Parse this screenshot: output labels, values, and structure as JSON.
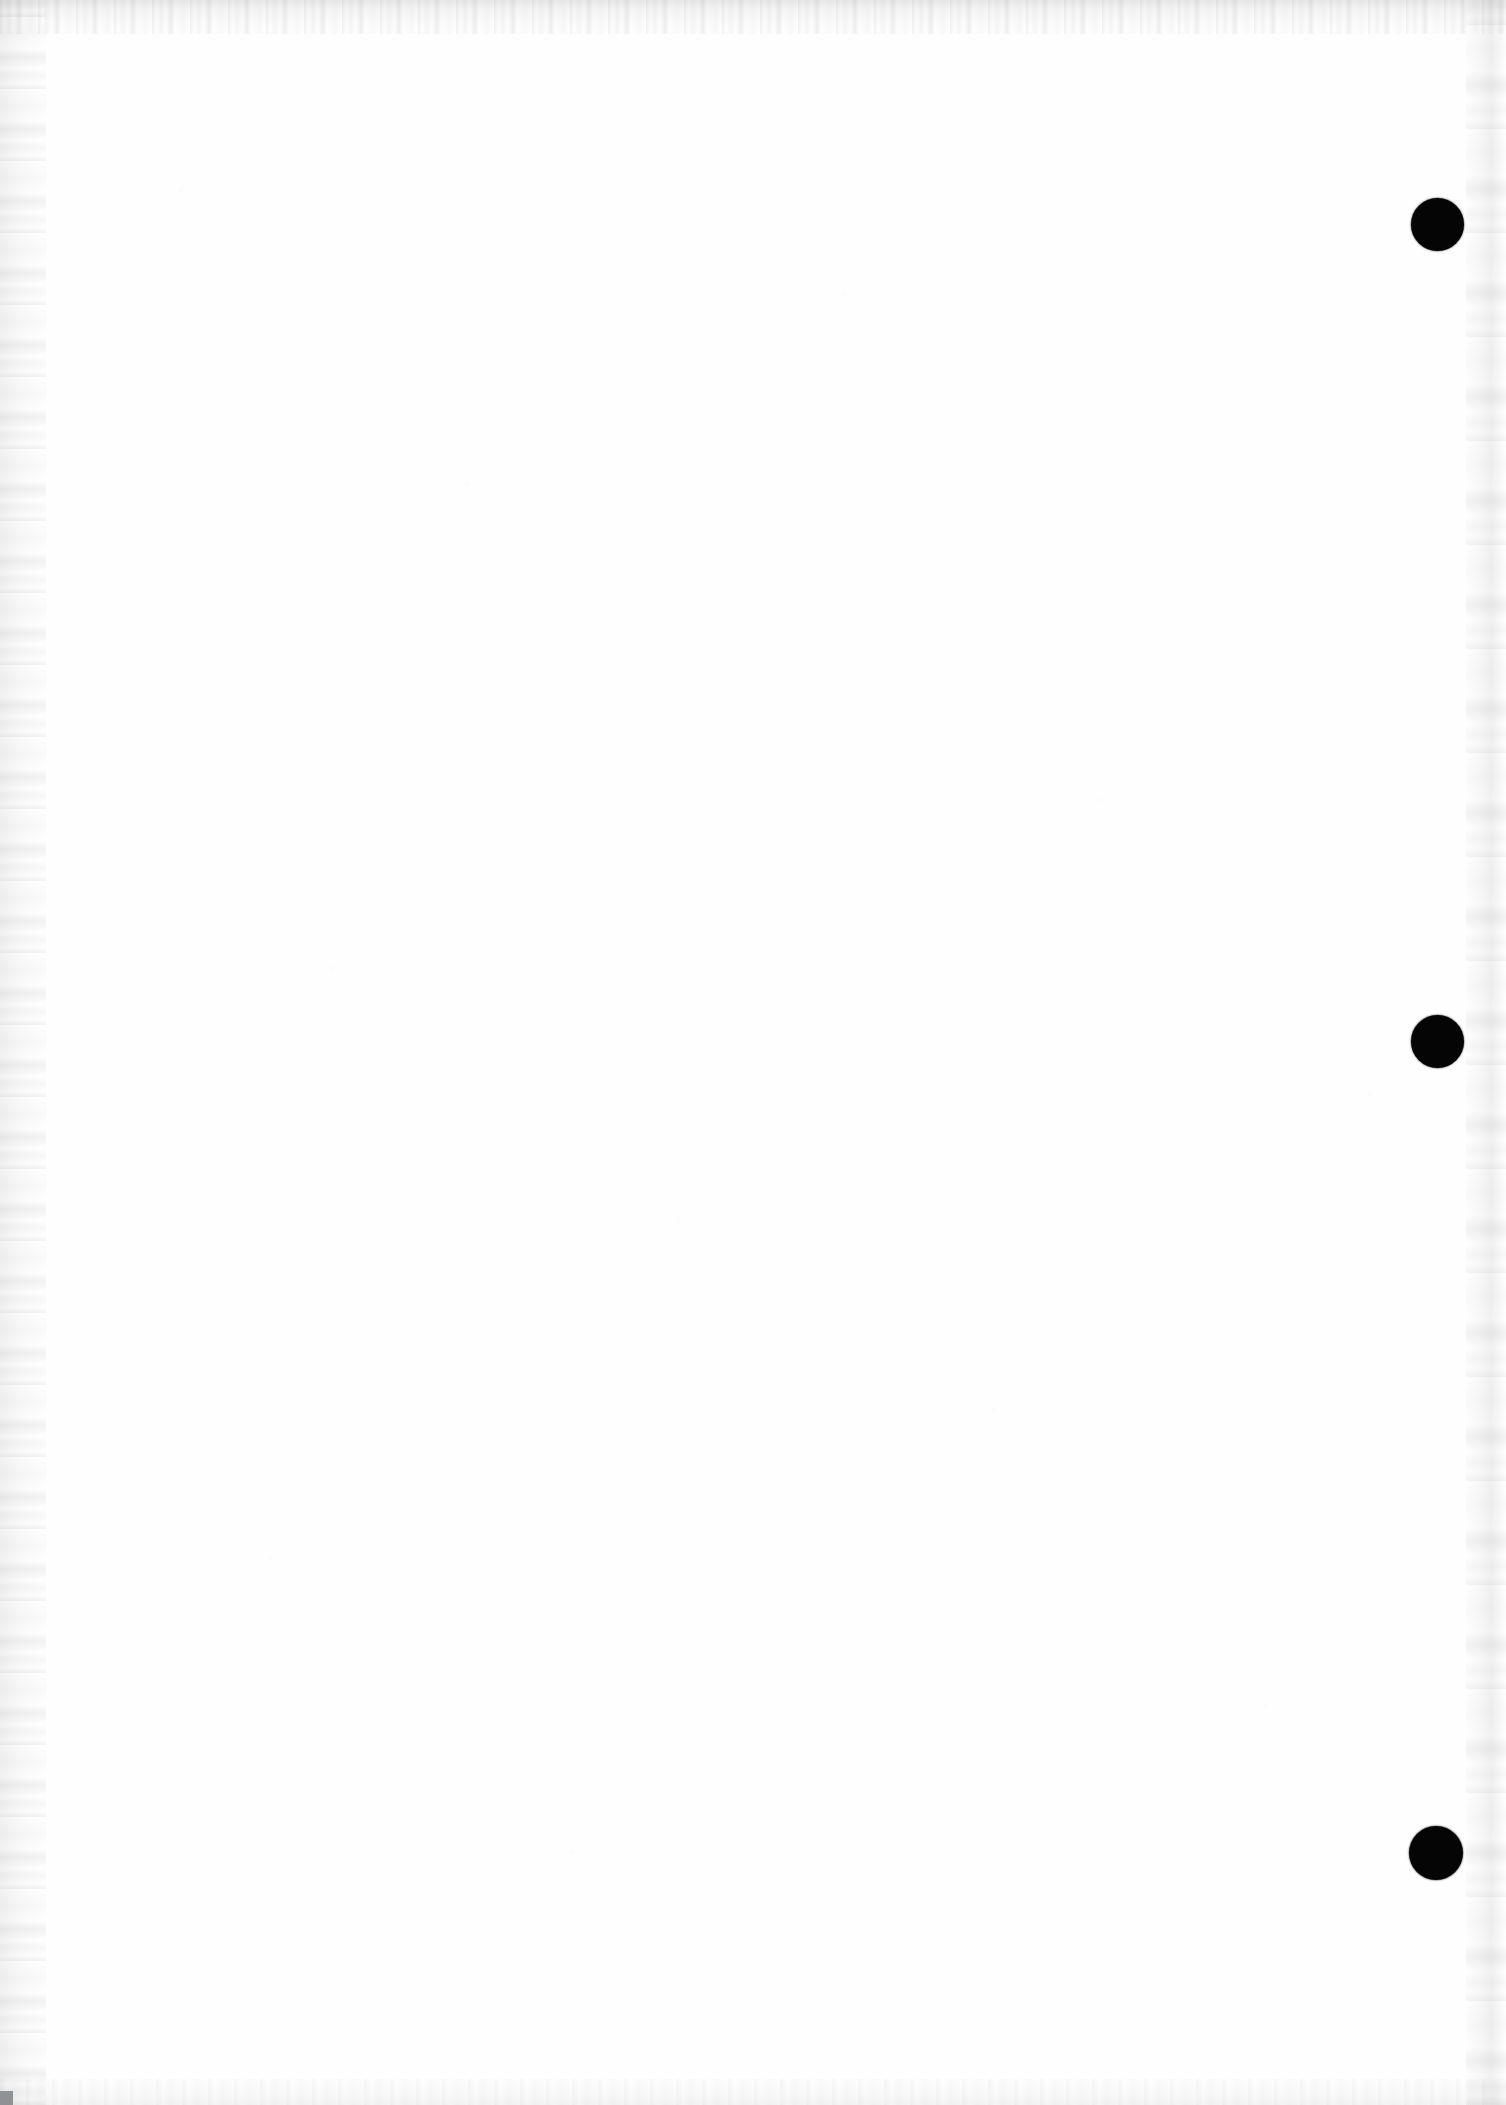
{
  "document": {
    "kind": "scanned-page",
    "page_width": 1506,
    "page_height": 2105,
    "body_text": "",
    "body_note": "",
    "background_color": "#fefefe",
    "ink_color": "#050505"
  },
  "marks": {
    "label": "registration-marks",
    "shape": "filled-circle",
    "color": "#050505",
    "count": 3,
    "items": [
      {
        "name": "registration-mark-top",
        "cx": 1437,
        "cy": 224,
        "diameter": 53
      },
      {
        "name": "registration-mark-middle",
        "cx": 1437,
        "cy": 1041,
        "diameter": 53
      },
      {
        "name": "registration-mark-bottom",
        "cx": 1436,
        "cy": 1853,
        "diameter": 54
      }
    ]
  },
  "scan_artifacts": {
    "top_edge_noise": "present",
    "left_edge_noise": "present",
    "bottom_edge_noise": "present",
    "right_edge_streak": "present",
    "bottom_left_corner_artifact_color": "#8f9194"
  }
}
